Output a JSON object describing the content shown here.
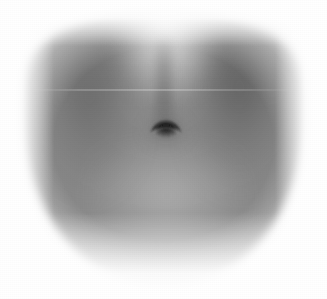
{
  "image": {
    "kind": "photograph",
    "subject": "human-abdomen",
    "view": "frontal-close-up",
    "color_mode": "grayscale",
    "width_px": 327,
    "height_px": 299,
    "background_color": "#ffffff",
    "caption": ""
  },
  "palette": {
    "background": "#ffffff",
    "skin_mid": "#8a8a8a",
    "skin_light": "#c8c8c8",
    "skin_highlight": "#f2f2f2",
    "flank_shadow_left": "#5f5f5f",
    "flank_shadow_right": "#575757",
    "navel_dark": "#2a2a2a",
    "navel_core": "#101010",
    "vignette": "#ffffff"
  },
  "regions": [
    {
      "name": "torso-body",
      "label": "Abdomen / torso mass",
      "center_x": 163,
      "center_y": 148,
      "width": 283,
      "height": 278,
      "tone": "#8a8a8a"
    },
    {
      "name": "flank-left",
      "label": "Left flank shadow",
      "center_x": 82,
      "center_y": 111,
      "width": 96,
      "height": 170,
      "tone": "#5f5f5f"
    },
    {
      "name": "flank-right",
      "label": "Right flank shadow",
      "center_x": 248,
      "center_y": 108,
      "width": 104,
      "height": 176,
      "tone": "#575757"
    },
    {
      "name": "center-highlight",
      "label": "Upper midline highlight",
      "center_x": 166,
      "center_y": 40,
      "width": 108,
      "height": 120,
      "tone": "#f2f2f2"
    },
    {
      "name": "linea-alba",
      "label": "Linea alba midline groove",
      "center_x": 164,
      "center_y": 78,
      "width": 16,
      "height": 96,
      "tone": "#6e6e6e"
    },
    {
      "name": "lower-belly",
      "label": "Lower belly rounding highlight",
      "center_x": 167,
      "center_y": 207,
      "width": 150,
      "height": 110,
      "tone": "#bfbfbf"
    },
    {
      "name": "rib-shadow",
      "label": "Subcostal shadow band",
      "center_x": 164,
      "center_y": 63,
      "width": 228,
      "height": 58,
      "tone": "#787878"
    }
  ],
  "navel": {
    "label": "Navel (umbilicus)",
    "shape": "inverted-crescent",
    "center_x": 166,
    "center_y": 130,
    "width": 34,
    "height": 18,
    "core_color": "#141414",
    "rim_color": "#3b3b3b"
  },
  "artifacts": [
    {
      "name": "scanline-artifact",
      "label": "Faint horizontal scan line",
      "y": 89,
      "x_start": 30,
      "x_end": 298
    }
  ],
  "vignette": {
    "label": "Soft white vignette",
    "top_px": 46,
    "bottom_px": 86,
    "left_px": 54,
    "right_px": 52
  }
}
